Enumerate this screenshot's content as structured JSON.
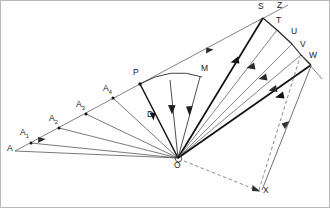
{
  "figure": {
    "width": 330,
    "height": 208,
    "background_color": "#fefefe",
    "border_color": "#b8b8b8",
    "stroke_dark": "#1a1a1a",
    "stroke_mid": "#555555",
    "stroke_light": "#8a8a8a",
    "dashed_color": "#777777"
  },
  "points": [
    {
      "id": "A",
      "label": "A",
      "sub": "",
      "x": 15,
      "y": 151,
      "label_x": 9,
      "label_y": 146,
      "dot": false
    },
    {
      "id": "A1",
      "label": "A",
      "sub": "1",
      "x": 31,
      "y": 143,
      "label_x": 22,
      "label_y": 131,
      "dot": true
    },
    {
      "id": "A2",
      "label": "A",
      "sub": "2",
      "x": 59,
      "y": 128,
      "label_x": 51,
      "label_y": 117,
      "dot": true
    },
    {
      "id": "A3",
      "label": "A",
      "sub": "3",
      "x": 86,
      "y": 114,
      "label_x": 78,
      "label_y": 103,
      "dot": true
    },
    {
      "id": "A4",
      "label": "A",
      "sub": "4",
      "x": 113,
      "y": 98,
      "label_x": 105,
      "label_y": 87,
      "dot": true
    },
    {
      "id": "P",
      "label": "P",
      "sub": "",
      "x": 140,
      "y": 84,
      "label_x": 135,
      "label_y": 71,
      "dot": true
    },
    {
      "id": "M",
      "label": "M",
      "sub": "",
      "x": 200,
      "y": 77,
      "label_x": 200,
      "label_y": 67,
      "dot": false
    },
    {
      "id": "D",
      "label": "D",
      "sub": "",
      "x": 152,
      "y": 120,
      "label_x": 148,
      "label_y": 113,
      "dot": false
    },
    {
      "id": "S",
      "label": "S",
      "sub": "",
      "x": 263,
      "y": 18,
      "label_x": 259,
      "label_y": 5,
      "dot": false
    },
    {
      "id": "Z",
      "label": "Z",
      "sub": "",
      "x": 283,
      "y": 11,
      "label_x": 277,
      "label_y": 4,
      "dot": false
    },
    {
      "id": "T",
      "label": "T",
      "sub": "",
      "x": 277,
      "y": 30,
      "label_x": 277,
      "label_y": 19,
      "dot": false
    },
    {
      "id": "U",
      "label": "U",
      "sub": "",
      "x": 292,
      "y": 44,
      "label_x": 291,
      "label_y": 29,
      "dot": false
    },
    {
      "id": "V",
      "label": "V",
      "sub": "",
      "x": 301,
      "y": 55,
      "label_x": 300,
      "label_y": 42,
      "dot": false
    },
    {
      "id": "W",
      "label": "W",
      "sub": "",
      "x": 311,
      "y": 65,
      "label_x": 309,
      "label_y": 53,
      "dot": false
    },
    {
      "id": "O",
      "label": "O",
      "sub": "",
      "x": 178,
      "y": 158,
      "label_x": 173,
      "label_y": 161,
      "dot": false
    },
    {
      "id": "X",
      "label": "X",
      "sub": "",
      "x": 261,
      "y": 192,
      "label_x": 262,
      "label_y": 188,
      "dot": false
    }
  ],
  "segments": {
    "left_axis": {
      "name": "A-to-S baseline",
      "from": "A",
      "to": "S",
      "weight": "light",
      "arrow_mid": true
    },
    "fan_left": [
      {
        "name": "O-to-A",
        "from": "O",
        "to": "A",
        "weight": "mid"
      },
      {
        "name": "O-to-A1",
        "from": "O",
        "to": "A1",
        "weight": "mid"
      },
      {
        "name": "O-to-A2",
        "from": "O",
        "to": "A2",
        "weight": "mid"
      },
      {
        "name": "O-to-A3",
        "from": "O",
        "to": "A3",
        "weight": "mid"
      },
      {
        "name": "O-to-A4",
        "from": "O",
        "to": "A4",
        "weight": "mid"
      },
      {
        "name": "O-to-P",
        "from": "O",
        "to": "P",
        "weight": "dark"
      },
      {
        "name": "O-to-D",
        "from": "O",
        "to": "D",
        "weight": "mid"
      },
      {
        "name": "O-to-M",
        "from": "O",
        "to": "M",
        "weight": "mid"
      }
    ],
    "fan_right": [
      {
        "name": "O-to-S",
        "from": "O",
        "to": "S",
        "weight": "dark"
      },
      {
        "name": "O-to-T",
        "from": "O",
        "to": "T",
        "weight": "light"
      },
      {
        "name": "O-to-U",
        "from": "O",
        "to": "U",
        "weight": "light"
      },
      {
        "name": "O-to-V",
        "from": "O",
        "to": "V",
        "weight": "light"
      },
      {
        "name": "O-to-W",
        "from": "O",
        "to": "W",
        "weight": "dark"
      }
    ],
    "arc": {
      "name": "arc-P-to-M",
      "from": "P",
      "to": "M"
    },
    "dashed": [
      {
        "name": "O-to-X-dashed",
        "from": "O",
        "to": "X"
      },
      {
        "name": "X-to-V-dashed",
        "from": "X",
        "to": "V"
      }
    ],
    "x_to_w": {
      "name": "X-to-W-ray",
      "from": "X",
      "to": "W"
    },
    "sz_tick": {
      "name": "S-Z-tick"
    },
    "w_tick": {
      "name": "W-cross-tick"
    }
  },
  "labels_note": "Points labelled A, A1, A2, A3, A4, P, M, D, S, Z, T, U, V, W, O, X"
}
